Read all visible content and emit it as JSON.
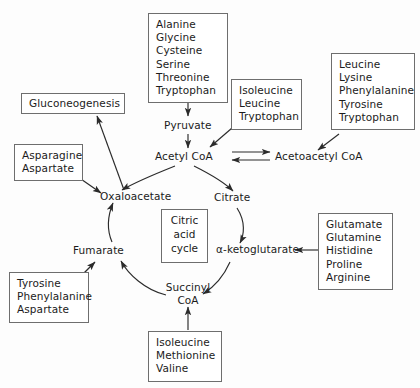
{
  "diagram": {
    "center_box": {
      "lines": [
        "Citric",
        "acid",
        "cycle"
      ]
    },
    "cycle_nodes": [
      {
        "id": "pyruvate",
        "label": "Pyruvate"
      },
      {
        "id": "acetyl-coa",
        "label": "Acetyl CoA"
      },
      {
        "id": "acetoacetyl-coa",
        "label": "Acetoacetyl CoA"
      },
      {
        "id": "oxaloacetate",
        "label": "Oxaloacetate"
      },
      {
        "id": "citrate",
        "label": "Citrate"
      },
      {
        "id": "alpha-ketoglutarate",
        "label": "α-ketoglutarate"
      },
      {
        "id": "succinyl-coa-line1",
        "label": "Succinyl"
      },
      {
        "id": "succinyl-coa-line2",
        "label": "CoA"
      },
      {
        "id": "fumarate",
        "label": "Fumarate"
      }
    ],
    "boxes": [
      {
        "id": "gluconeogenesis",
        "lines": [
          "Gluconeogenesis"
        ]
      },
      {
        "id": "pyruvate-precursors",
        "lines": [
          "Alanine",
          "Glycine",
          "Cysteine",
          "Serine",
          "Threonine",
          "Tryptophan"
        ]
      },
      {
        "id": "acetyl-coa-precursors",
        "lines": [
          "Isoleucine",
          "Leucine",
          "Tryptophan"
        ]
      },
      {
        "id": "acetoacetyl-coa-precursors",
        "lines": [
          "Leucine",
          "Lysine",
          "Phenylalanine",
          "Tyrosine",
          "Tryptophan"
        ]
      },
      {
        "id": "oxaloacetate-precursors",
        "lines": [
          "Asparagine",
          "Aspartate"
        ]
      },
      {
        "id": "alpha-ketoglutarate-precursors",
        "lines": [
          "Glutamate",
          "Glutamine",
          "Histidine",
          "Proline",
          "Arginine"
        ]
      },
      {
        "id": "fumarate-precursors",
        "lines": [
          "Tyrosine",
          "Phenylalanine",
          "Aspartate"
        ]
      },
      {
        "id": "succinyl-coa-precursors",
        "lines": [
          "Isoleucine",
          "Methionine",
          "Valine"
        ]
      }
    ],
    "colors": {
      "text": "#1b1b1b",
      "stroke": "#2b2b2b",
      "box_border": "#6e6e6e",
      "background": "#fdfdfd"
    }
  }
}
